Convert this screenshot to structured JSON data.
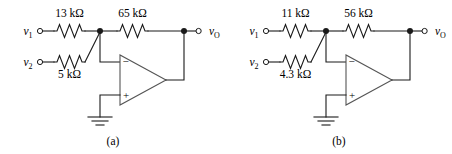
{
  "figure": {
    "type": "circuit-diagram",
    "background_color": "#ffffff",
    "line_color": "#1a1a1a"
  },
  "circuits": [
    {
      "caption": "(a)",
      "input_top": {
        "terminal_label": "v",
        "terminal_sub": "1",
        "resistor_label": "13 kΩ"
      },
      "input_bottom": {
        "terminal_label": "v",
        "terminal_sub": "2",
        "resistor_label": "5 kΩ"
      },
      "feedback": {
        "resistor_label": "65 kΩ"
      },
      "output": {
        "terminal_label": "v",
        "terminal_sub": "O"
      },
      "opamp": {
        "inverting_sign": "−",
        "noninverting_sign": "+",
        "icon": "opamp-triangle-icon"
      },
      "ground": {
        "icon": "ground-icon"
      }
    },
    {
      "caption": "(b)",
      "input_top": {
        "terminal_label": "v",
        "terminal_sub": "1",
        "resistor_label": "11 kΩ"
      },
      "input_bottom": {
        "terminal_label": "v",
        "terminal_sub": "2",
        "resistor_label": "4.3 kΩ"
      },
      "feedback": {
        "resistor_label": "56 kΩ"
      },
      "output": {
        "terminal_label": "v",
        "terminal_sub": "O"
      },
      "opamp": {
        "inverting_sign": "−",
        "noninverting_sign": "+",
        "icon": "opamp-triangle-icon"
      },
      "ground": {
        "icon": "ground-icon"
      }
    }
  ]
}
